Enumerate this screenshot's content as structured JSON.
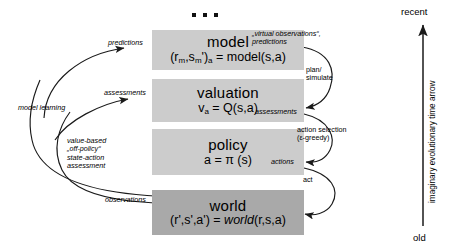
{
  "diagram": {
    "title_dots": "…",
    "boxes": [
      {
        "key": "model",
        "name": "model",
        "formula_plain": "(r",
        "formula": "(r_m,s_m')_a = model(s,a)",
        "color": "#cccccc"
      },
      {
        "key": "valuation",
        "name": "valuation",
        "formula": "v_a = Q(s,a)",
        "color": "#cccccc"
      },
      {
        "key": "policy",
        "name": "policy",
        "formula": "a = π (s)",
        "color": "#cccccc"
      },
      {
        "key": "world",
        "name": "world",
        "formula": "(r',s',a') = world(r,s,a)",
        "color": "#a9a9a9"
      }
    ],
    "left_labels": {
      "predictions": "predictions",
      "assessments": "assessments",
      "observations": "observations",
      "model_learning": "model learning",
      "value_based": "value-based",
      "off_policy": "„off-policy“",
      "state_action": "state-action",
      "assessment": "assessment"
    },
    "right_labels": {
      "virtual_observations": "„virtual observations“,",
      "predictions": "predictions",
      "plan": "plan/",
      "simulate": "simulate",
      "assessments": "assessments",
      "action_selection": "action selection",
      "epsilon_greedy": "(ε-greedy)",
      "actions": "actions",
      "act": "act"
    },
    "time_axis": {
      "top": "recent",
      "bottom": "old",
      "caption": "imaginary evolutionary time arrow"
    }
  }
}
